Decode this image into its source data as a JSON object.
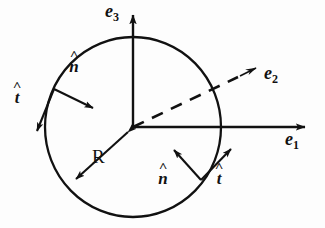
{
  "figure": {
    "background_color": "#fdfdfd",
    "ink_color": "#111111",
    "canvas": {
      "width": 325,
      "height": 228
    }
  },
  "circle": {
    "name": "circle-outline",
    "center_x": 133,
    "center_y": 127,
    "radius_x": 88,
    "radius_y": 90,
    "stroke_width": 2.2
  },
  "axes": [
    {
      "id": "e1",
      "label_base": "e",
      "label_sub": "1",
      "style": "solid",
      "direction": "right",
      "from_x": 133,
      "from_y": 127,
      "to_x": 308,
      "to_y": 127,
      "label_x": 286,
      "label_y": 132
    },
    {
      "id": "e2",
      "label_base": "e",
      "label_sub": "2",
      "style": "dashed",
      "direction": "up-right",
      "from_x": 133,
      "from_y": 127,
      "to_x": 257,
      "to_y": 68,
      "label_x": 266,
      "label_y": 74
    },
    {
      "id": "e3",
      "label_base": "e",
      "label_sub": "3",
      "style": "solid",
      "direction": "up",
      "from_x": 133,
      "from_y": 127,
      "to_x": 133,
      "to_y": 12,
      "label_x": 105,
      "label_y": 3
    }
  ],
  "vectors": [
    {
      "id": "n-upper-left",
      "symbol": "n",
      "accent": "^",
      "description": "outward unit normal at upper-left point of circle",
      "from_x": 54,
      "from_y": 89,
      "to_x": 97,
      "to_y": 110,
      "label_x": 71,
      "label_y": 56
    },
    {
      "id": "t-upper-left",
      "symbol": "t",
      "accent": "^",
      "description": "unit tangent at upper-left point of circle",
      "from_x": 54,
      "from_y": 89,
      "to_x": 35,
      "to_y": 136,
      "label_x": 13,
      "label_y": 87
    },
    {
      "id": "n-lower-right",
      "symbol": "n",
      "accent": "^",
      "description": "unit normal at lower-right point of circle",
      "from_x": 201,
      "from_y": 180,
      "to_x": 171,
      "to_y": 146,
      "label_x": 161,
      "label_y": 168
    },
    {
      "id": "t-lower-right",
      "symbol": "t",
      "accent": "^",
      "description": "unit tangent at lower-right point of circle",
      "from_x": 201,
      "from_y": 180,
      "to_x": 234,
      "to_y": 145,
      "label_x": 216,
      "label_y": 168
    }
  ],
  "radius": {
    "id": "radius-measure",
    "label": "R",
    "description": "double-headed radius arrow from center to lower-left of circle",
    "from_x": 131,
    "from_y": 129,
    "to_x": 72,
    "to_y": 183,
    "label_x": 96,
    "label_y": 158
  }
}
